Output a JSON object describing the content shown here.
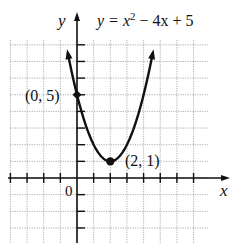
{
  "chart_data": {
    "type": "line",
    "equation": {
      "lhs": "y = x",
      "exp": "2",
      "rhs": " − 4x + 5"
    },
    "xlabel": "x",
    "ylabel": "y",
    "origin_label": "0",
    "xlim": [
      -4,
      8
    ],
    "ylim": [
      -4,
      8
    ],
    "grid": true,
    "grid_style": "dotted",
    "legend": null,
    "series": [
      {
        "name": "y = x^2 - 4x + 5",
        "x": [
          -0.55,
          0,
          0.5,
          1,
          1.5,
          2,
          2.5,
          3,
          3.5,
          4,
          4.5,
          4.55
        ],
        "y": [
          7.5,
          5,
          3.25,
          2,
          1.25,
          1,
          1.25,
          2,
          3.25,
          5,
          7.25,
          7.5
        ],
        "color": "#111111"
      }
    ],
    "annotations": [
      {
        "label": "(0, 5)",
        "x": 0,
        "y": 5,
        "marker": "point"
      },
      {
        "label": "(2, 1)",
        "x": 2,
        "y": 1,
        "marker": "point"
      }
    ]
  }
}
